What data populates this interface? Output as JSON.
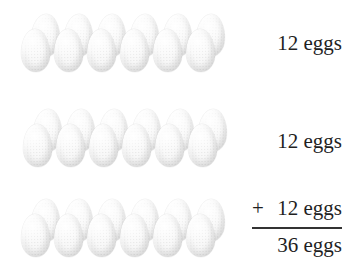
{
  "figure": {
    "rows": [
      {
        "name": "row-1",
        "label": "12 eggs",
        "eggs": 12,
        "pairs": 6
      },
      {
        "name": "row-2",
        "label": "12 eggs",
        "eggs": 12,
        "pairs": 6
      },
      {
        "name": "row-3",
        "label": "12 eggs",
        "eggs": 12,
        "pairs": 6
      }
    ],
    "sum": {
      "operator": "+",
      "addend_label": "12 eggs",
      "total_label": "36 eggs"
    },
    "colors": {
      "background": "#ffffff",
      "text": "#1f1f1f",
      "rule": "#333333",
      "egg_base": "#f4f4f4",
      "egg_shade": "#e2e2e2",
      "egg_highlight": "#ffffff"
    }
  }
}
